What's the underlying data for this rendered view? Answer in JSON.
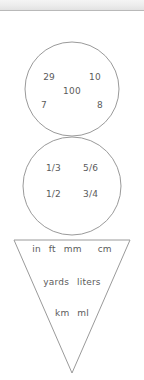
{
  "header": {
    "bar_label": "window-title-bar",
    "background": "#ececec",
    "border_color": "#b9b9b9"
  },
  "canvas": {
    "stroke_color": "#9a9a9a",
    "text_color": "#5b5b5b",
    "background": "#ffffff"
  },
  "shapes": [
    {
      "type": "circle",
      "name": "whole-numbers-circle",
      "cx": 72,
      "cy": 89,
      "r": 47
    },
    {
      "type": "circle",
      "name": "fractions-circle",
      "cx": 72,
      "cy": 186,
      "r": 49
    },
    {
      "type": "triangle",
      "name": "units-triangle",
      "points": "14,240 130,240 72,373"
    }
  ],
  "circle_numbers": {
    "row1": {
      "left": "29",
      "right": "10"
    },
    "row2": {
      "center": "100"
    },
    "row3": {
      "left": "7",
      "right": "8"
    }
  },
  "circle_fractions": {
    "row1": {
      "left": "1/3",
      "right": "5/6"
    },
    "row2": {
      "left": "1/2",
      "right": "3/4"
    }
  },
  "triangle_units": {
    "row1": {
      "item1": "in",
      "item2": "ft",
      "item2_underlined": true,
      "item3": "mm",
      "item4": "cm"
    },
    "row2": {
      "item1": "yards",
      "item2": "liters"
    },
    "row3": {
      "item1": "km",
      "item2": "ml"
    }
  }
}
